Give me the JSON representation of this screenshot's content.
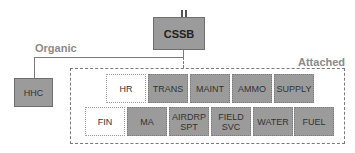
{
  "diagram": {
    "type": "org-chart",
    "root": {
      "label": "CSSB",
      "echelon_symbol": "II"
    },
    "labels": {
      "organic": "Organic",
      "attached": "Attached"
    },
    "organic_units": [
      {
        "label": "HHC"
      }
    ],
    "attached_units": {
      "row1": [
        {
          "label": "HR",
          "filled": false
        },
        {
          "label": "TRANS",
          "filled": true
        },
        {
          "label": "MAINT",
          "filled": true
        },
        {
          "label": "AMMO",
          "filled": true
        },
        {
          "label": "SUPPLY",
          "filled": true
        }
      ],
      "row2": [
        {
          "label": "FIN",
          "filled": false
        },
        {
          "label": "MA",
          "filled": true
        },
        {
          "label": "AIRDRP\nSPT",
          "filled": true
        },
        {
          "label": "FIELD\nSVC",
          "filled": true
        },
        {
          "label": "WATER",
          "filled": true
        },
        {
          "label": "FUEL",
          "filled": true
        }
      ]
    },
    "colors": {
      "unit_fill": "#9b9b9b",
      "line": "#7a7a7a",
      "label_text": "#8a8a8a"
    }
  }
}
